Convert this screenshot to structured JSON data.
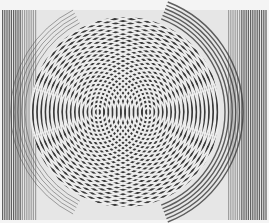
{
  "image": {
    "description": "Grayscale photograph of a moiré interference pattern formed by two overlapping sets of concentric rings, with vertical stripe bands at left and right edges",
    "width": 269,
    "height": 223,
    "colors": {
      "background": "#f4f4f4",
      "paper": "#e6e6e6",
      "ink": "#3a3a3a",
      "edge_stripes": "#4a4a4a"
    },
    "pattern": {
      "center_a": [
        98,
        112
      ],
      "center_b": [
        148,
        112
      ],
      "ring_spacing": 4.2,
      "disc_center": [
        125,
        112
      ],
      "disc_radius": 95
    }
  }
}
